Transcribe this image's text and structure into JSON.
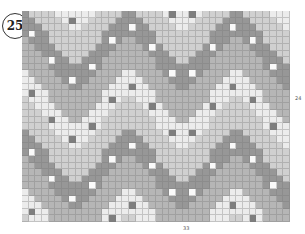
{
  "badge": {
    "number": "25"
  },
  "labels": {
    "rows": "24",
    "cols": "33"
  },
  "chart_data": {
    "type": "heatmap",
    "grid": {
      "cols": 40,
      "rows": 32
    },
    "repeat": {
      "chevron_period_cols": 16,
      "valley_offset_col": 7.5,
      "amplitude_rows": 10
    },
    "colors": {
      "lightest": "#ececec",
      "light": "#d0d0d0",
      "mid": "#b6b6b6",
      "dark": "#979797",
      "dot_light": "#fafafa",
      "dot_dark": "#7e7e7e",
      "gridline": "#8a8a8a"
    },
    "bands": [
      {
        "name": "lightest",
        "start_row": -10,
        "thickness": 4,
        "dots": "dot_dark"
      },
      {
        "name": "light",
        "start_row": -6,
        "thickness": 5,
        "dots": null
      },
      {
        "name": "dark",
        "start_row": -1,
        "thickness": 4,
        "dots": "dot_light"
      },
      {
        "name": "mid",
        "start_row": 3,
        "thickness": 5,
        "dots": null
      },
      {
        "name": "lightest",
        "start_row": 8,
        "thickness": 4,
        "dots": "dot_dark"
      },
      {
        "name": "light",
        "start_row": 12,
        "thickness": 5,
        "dots": null
      },
      {
        "name": "dark",
        "start_row": 17,
        "thickness": 4,
        "dots": "dot_light"
      },
      {
        "name": "mid",
        "start_row": 21,
        "thickness": 5,
        "dots": null
      },
      {
        "name": "lightest",
        "start_row": 26,
        "thickness": 4,
        "dots": "dot_dark"
      },
      {
        "name": "light",
        "start_row": 30,
        "thickness": 5,
        "dots": null
      }
    ],
    "xlabel": "33",
    "ylabel": "24"
  }
}
